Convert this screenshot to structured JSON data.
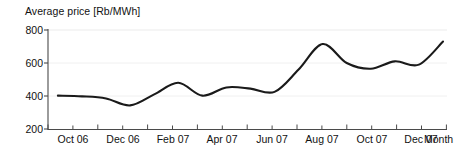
{
  "chart_data": {
    "type": "line",
    "title": "Average price [Rb/MWh]",
    "ylabel": "Average price [Rb/MWh]",
    "xlabel": "Month",
    "ylim": [
      200,
      800
    ],
    "y_ticks": [
      200,
      400,
      600,
      800
    ],
    "y_tick_labels": [
      "200",
      "400",
      "600",
      "800"
    ],
    "grid": true,
    "grid_axis": "y",
    "legend": false,
    "x_tick_labels": [
      "Oct 06",
      "Dec 06",
      "Feb 07",
      "Apr 07",
      "Jun 07",
      "Aug 07",
      "Oct 07",
      "Dec 07"
    ],
    "x_minor_ticks_per_label": 2,
    "categories": [
      "Sep 06",
      "Oct 06",
      "Nov 06",
      "Dec 06",
      "Jan 07",
      "Feb 07",
      "Mar 07",
      "Apr 07",
      "May 07",
      "Jun 07",
      "Jul 07",
      "Aug 07",
      "Sep 07",
      "Oct 07",
      "Nov 07",
      "Dec 07",
      "Jan 08"
    ],
    "values": [
      402,
      398,
      385,
      343,
      410,
      480,
      402,
      452,
      445,
      425,
      560,
      715,
      600,
      565,
      610,
      590,
      730
    ],
    "series": [
      {
        "name": "Average price",
        "color": "#1a1a1a",
        "values": [
          402,
          398,
          385,
          343,
          410,
          480,
          402,
          452,
          445,
          425,
          560,
          715,
          600,
          565,
          610,
          590,
          730
        ]
      }
    ],
    "annotations": []
  },
  "axes": {
    "y_title": "Average price [Rb/MWh]",
    "x_title": "Month",
    "y_labels": [
      "800",
      "600",
      "400",
      "200"
    ],
    "x_labels": [
      "Oct 06",
      "Dec 06",
      "Feb 07",
      "Apr 07",
      "Jun 07",
      "Aug 07",
      "Oct 07",
      "Dec 07"
    ]
  },
  "colors": {
    "line": "#1a1a1a",
    "axis": "#4a4a4a",
    "grid": "#e8e8e8",
    "background": "#ffffff",
    "text": "#111111"
  }
}
